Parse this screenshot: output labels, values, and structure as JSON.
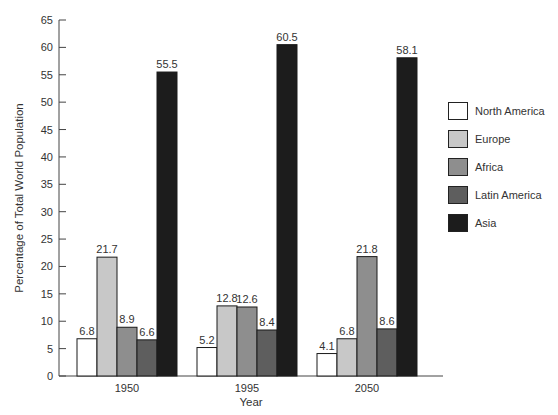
{
  "chart_data": {
    "type": "bar",
    "title": "",
    "xlabel": "Year",
    "ylabel": "Percentage of Total World Population",
    "categories": [
      "1950",
      "1995",
      "2050"
    ],
    "ylim": [
      0,
      65
    ],
    "yticks": [
      0,
      5,
      10,
      15,
      20,
      25,
      30,
      35,
      40,
      45,
      50,
      55,
      60,
      65
    ],
    "grid": false,
    "legend_position": "right",
    "series": [
      {
        "name": "North America",
        "color": "#ffffff",
        "values": [
          6.8,
          5.2,
          4.1
        ]
      },
      {
        "name": "Europe",
        "color": "#c8c8c8",
        "values": [
          21.7,
          12.8,
          6.8
        ]
      },
      {
        "name": "Africa",
        "color": "#8e8e8e",
        "values": [
          8.9,
          12.6,
          21.8
        ]
      },
      {
        "name": "Latin America",
        "color": "#5e5e5e",
        "values": [
          6.6,
          8.4,
          8.6
        ]
      },
      {
        "name": "Asia",
        "color": "#1c1c1c",
        "values": [
          55.5,
          60.5,
          58.1
        ]
      }
    ]
  }
}
